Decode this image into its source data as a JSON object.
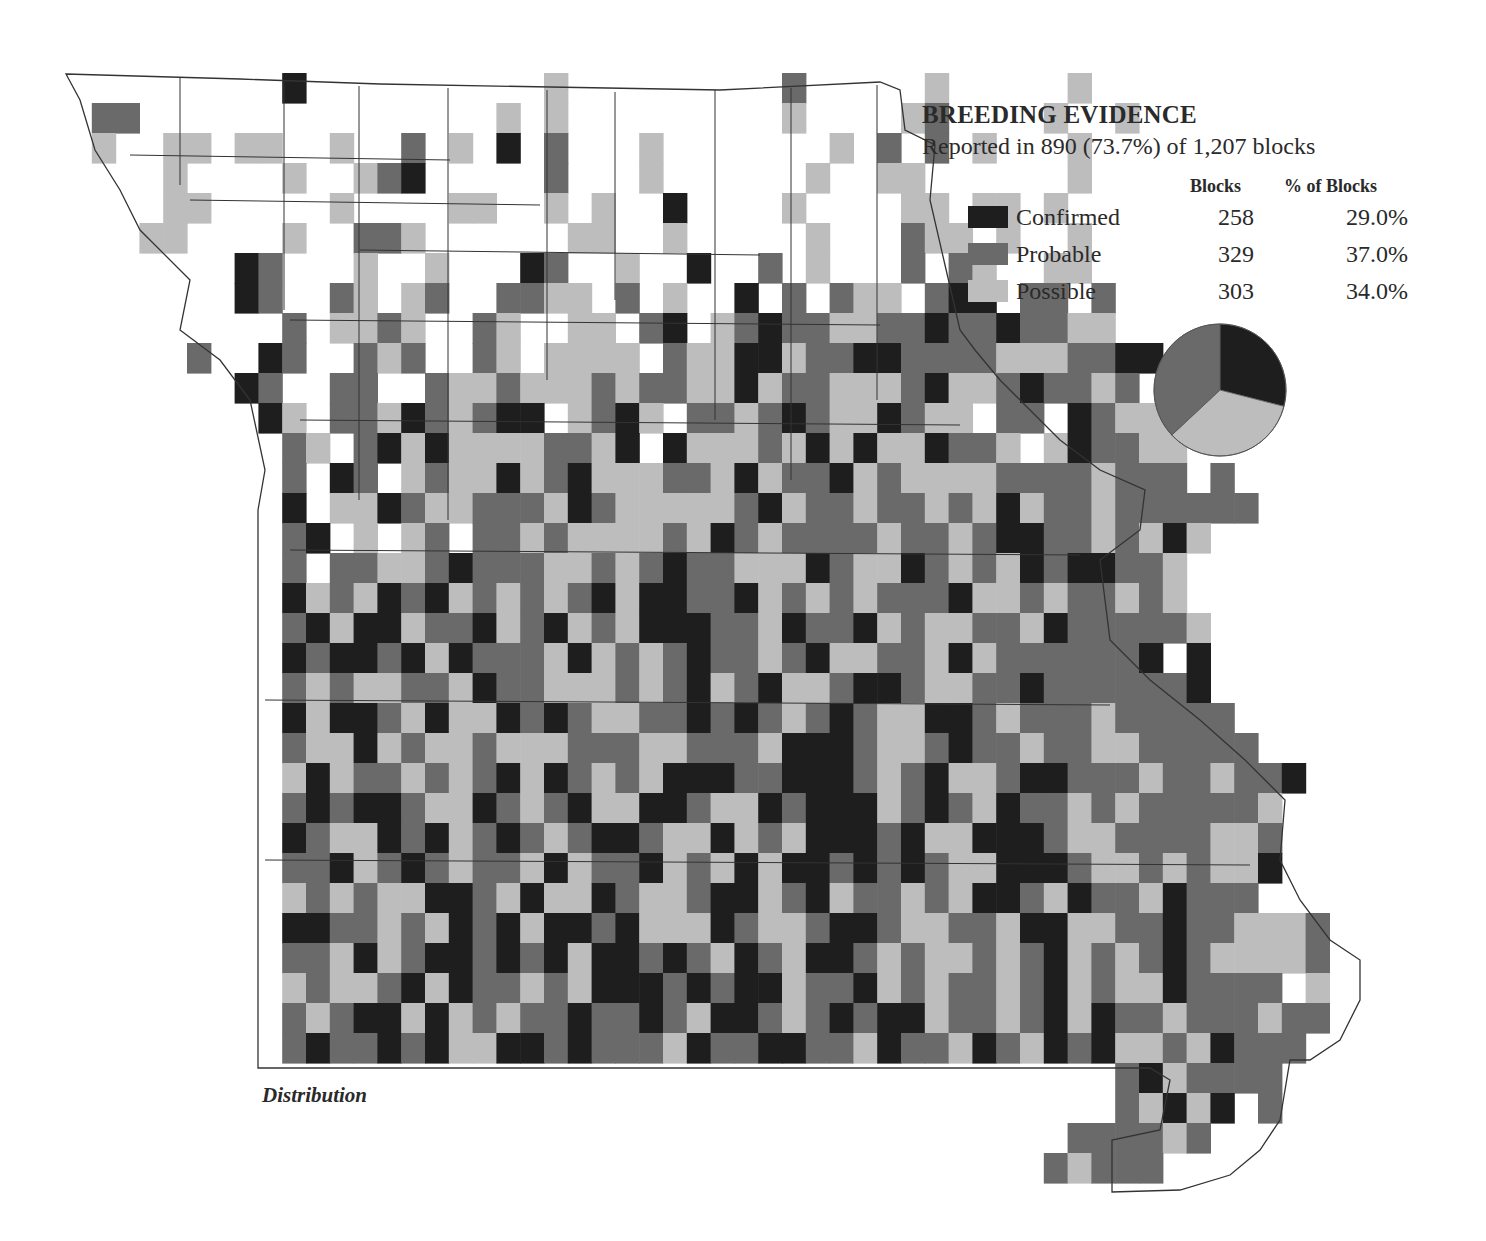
{
  "legend": {
    "title": "BREEDING EVIDENCE",
    "subtitle": "Reported in 890 (73.7%) of 1,207 blocks",
    "col_blocks": "Blocks",
    "col_pct": "% of Blocks",
    "rows": [
      {
        "key": "C",
        "label": "Confirmed",
        "blocks": "258",
        "pct": "29.0%",
        "color": "#1e1e1e"
      },
      {
        "key": "P",
        "label": "Probable",
        "blocks": "329",
        "pct": "37.0%",
        "color": "#6a6a6a"
      },
      {
        "key": "S",
        "label": "Possible",
        "blocks": "303",
        "pct": "34.0%",
        "color": "#bdbdbd"
      }
    ]
  },
  "caption": "Distribution",
  "chart_data": {
    "type": "pie",
    "title": "BREEDING EVIDENCE",
    "subtitle": "Reported in 890 (73.7%) of 1,207 blocks",
    "categories": [
      "Confirmed",
      "Probable",
      "Possible"
    ],
    "values": [
      258,
      329,
      303
    ],
    "percentages": [
      29.0,
      37.0,
      34.0
    ],
    "total_reported": 890,
    "total_blocks": 1207,
    "reported_pct": 73.7
  },
  "grid": {
    "x0": 68,
    "y0": 73,
    "cw": 23.8,
    "ch": 30,
    "colors": {
      "C": "#1e1e1e",
      "P": "#6a6a6a",
      "S": "#bdbdbd"
    },
    "rows": [
      "         C          S         P     S     S     ",
      " PP               S S         S    SP    S  S   ",
      " S  SS SS  S  P S C P   S       S P P S   S     ",
      "    S    S  SPC     P   S      S  SS      S    ",
      "    SS     S    SS  S S  C    S    SS SS S     ",
      "   SS    S  PPS      SS  S     S   PSS S  S     ",
      "       CP   S  S   CP  S  C  P S   P PS  SS     ",
      "       CP  PS SP  PPSS P S  C P PSS PCC PP P     ",
      "         P SSPS  PS  SS PC SPCPPSSPPCPPCPPSS   ",
      "     P  CP  PSP  PS SSSS PSSCCSPPCCPPPPSSSPPCC   ",
      "       CP  PP  PSSPSSSPSPPSSCSPPSSSPCSSPCPPSP   ",
      "        CS PPSCPSPCC SPCS PPSPCPSSCPSS PP CPSSS   ",
      "         PS PCSCSSSSPPSC.CSSSPSCSCSSCPPS SCPPSS  ",
      "         P CP SPSSCSPCSSSPPSCSPPCSPSSSSPPPPSPPP P",
      "         C SSCPSSPPPSCPSSSSSPCSPPSPPSPSCSPPSPPPPPP",
      "         PC S SP PPSPSSSSPSCPSPPPPSPPSPCCPPSPSCS ",
      "         P PPSSPCPPPSSPSPCPPSSSCPSSCPSPSCPCCPPS  ",
      "         CSPSCPCSPSPSPCSCCPPCSPSPSPPPCSSPSPPSPS  ",
      "         PCSCCSPPCSPCSPSCCCPPSCPPCSPSSPPSCPPPPPS  ",
      "         CPCCPCSCPPPSCSPSPCPPSPCSSPPSCSPPPPPPC C  ",
      "         PSPSSPPSCPPSSSPSPCSPCSSPCCPSSPPCPPPPPPC  ",
      "         CSCCPSCSSCPCPSSPPCPCPSPCPSSCCPSPPPSPPPPP ",
      "         PSSCSPSSPSSSPPPSSPPPSCCCPSSPCPPSPPSSPPPPP",
      "         SCSPPSPSPCSCPSPSCCCPPCCCPSPCSSPCCPPPSPPSPPC",
      "         PCPCCPSSCPSPCSSCCPSSCPCCCSPCPSCPPSPSPPPPPS",
      "         CPSSCPCSPCPSPCCPSSCSPSCCCPCSSCCCPSSPPPPSSP",
      "         PPCSPCPSPPSCSPPCSPSCSCCPCPCPSSCCCPSSPSPSSC",
      "         SPSPSSCCPSCSSCPSSPCCSPCSPPSPSCCPSCPPSCPPP ",
      "         CCPPSPSCPCSCCPCSSSCPSSPCCPSSPPSCCSSPPCPPSSSP",
      "         PPSCSPCCPCPCSCCPCPSCPSCCPSPSSPSPCSPSPCPSSSSP",
      "         SPSSPCSCPPSPSCCCPCPCCSPPCSPSPPSPCSPSSCPPPP S",
      "         PSPCCSCSPSPPCPPCPSCCPSPCPCCSPPSPCSCPPSPPPSPP",
      "         PCPPCPCSSCCPCPPPSCPPCCPPSCPPSCPSCPCSSPSCPPP ",
      "                                            PCSPPPP",
      "                                            PSCSC P",
      "                                          PPPPSP  ",
      "                                         PSPPP    "
    ]
  }
}
